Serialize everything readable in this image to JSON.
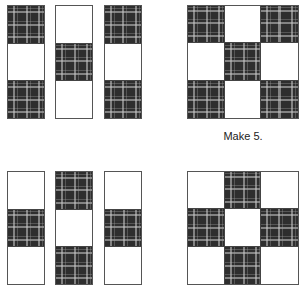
{
  "figure": {
    "caption": "Make 5.",
    "colors": {
      "dark_fabric": "#2e2e2e",
      "light_fabric": "#ffffff",
      "outline": "#555555"
    },
    "top_row": {
      "strips": [
        {
          "cells": [
            "dark",
            "light",
            "dark"
          ]
        },
        {
          "cells": [
            "light",
            "dark",
            "light"
          ]
        },
        {
          "cells": [
            "dark",
            "light",
            "dark"
          ]
        }
      ],
      "block": {
        "grid": [
          [
            "dark",
            "light",
            "dark"
          ],
          [
            "light",
            "dark",
            "light"
          ],
          [
            "dark",
            "light",
            "dark"
          ]
        ],
        "caption": "Make 5."
      }
    },
    "bottom_row": {
      "strips": [
        {
          "cells": [
            "light",
            "dark",
            "light"
          ]
        },
        {
          "cells": [
            "dark",
            "light",
            "dark"
          ]
        },
        {
          "cells": [
            "light",
            "dark",
            "light"
          ]
        }
      ],
      "block": {
        "grid": [
          [
            "light",
            "dark",
            "light"
          ],
          [
            "dark",
            "light",
            "dark"
          ],
          [
            "light",
            "dark",
            "light"
          ]
        ]
      }
    }
  }
}
